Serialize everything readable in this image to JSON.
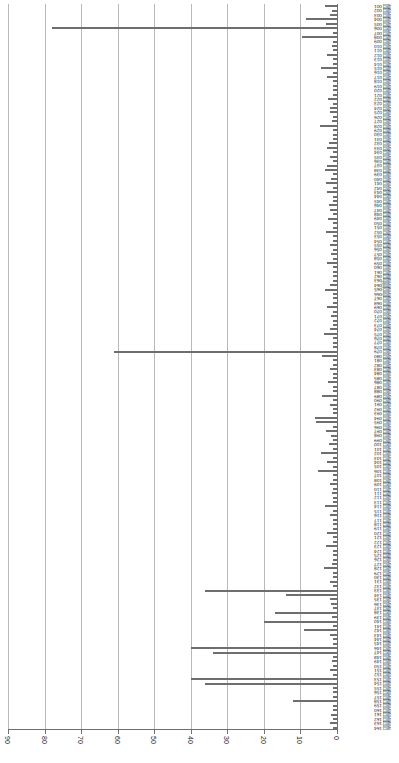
{
  "chart_data": {
    "type": "bar",
    "orientation": "horizontal",
    "title": "",
    "subtitle": "",
    "xlabel": "",
    "ylabel": "",
    "rotated_180": true,
    "axis_direction": "reversed",
    "grid": true,
    "legend": null,
    "bar_color": "#6e6e6e",
    "grid_color": "#b9b9b9",
    "axis_color": "#6f6f6f",
    "xlim": [
      0,
      90
    ],
    "xticks": [
      90,
      80,
      70,
      60,
      50,
      40,
      30,
      20,
      10,
      0
    ],
    "xticklabels": [
      "90",
      "80",
      "70",
      "60",
      "50",
      "40",
      "30",
      "20",
      "10",
      "0"
    ],
    "categories": [
      "项目 001",
      "项目 002",
      "项目 003",
      "项目 004",
      "项目 005",
      "项目 006",
      "项目 007",
      "项目 008",
      "项目 009",
      "项目 010",
      "项目 011",
      "项目 012",
      "项目 013",
      "项目 014",
      "项目 015",
      "项目 016",
      "项目 017",
      "项目 018",
      "项目 019",
      "项目 020",
      "项目 021",
      "项目 022",
      "项目 023",
      "项目 024",
      "项目 025",
      "项目 026",
      "项目 027",
      "项目 028",
      "项目 029",
      "项目 030",
      "项目 031",
      "项目 032",
      "项目 033",
      "项目 034",
      "项目 035",
      "项目 036",
      "项目 037",
      "项目 038",
      "项目 039",
      "项目 040",
      "项目 041",
      "项目 042",
      "项目 043",
      "项目 044",
      "项目 045",
      "项目 046",
      "项目 047",
      "项目 048",
      "项目 049",
      "项目 050",
      "项目 051",
      "项目 052",
      "项目 053",
      "项目 054",
      "项目 055",
      "项目 056",
      "项目 057",
      "项目 058",
      "项目 059",
      "项目 060",
      "项目 061",
      "项目 062",
      "项目 063",
      "项目 064",
      "项目 065",
      "项目 066",
      "项目 067",
      "项目 068",
      "项目 069",
      "项目 070",
      "项目 071",
      "项目 072",
      "项目 073",
      "项目 074",
      "项目 075",
      "项目 076",
      "项目 077",
      "项目 078",
      "项目 079",
      "项目 080",
      "项目 081",
      "项目 082",
      "项目 083",
      "项目 084",
      "项目 085",
      "项目 086",
      "项目 087",
      "项目 088",
      "项目 089",
      "项目 090",
      "项目 091",
      "项目 092",
      "项目 093",
      "项目 094",
      "项目 095",
      "项目 096",
      "项目 097",
      "项目 098",
      "项目 099",
      "项目 100",
      "项目 101",
      "项目 102",
      "项目 103",
      "项目 104",
      "项目 105",
      "项目 106",
      "项目 107",
      "项目 108",
      "项目 109",
      "项目 110",
      "项目 111",
      "项目 112",
      "项目 113",
      "项目 114",
      "项目 115",
      "项目 116",
      "项目 117",
      "项目 118",
      "项目 119",
      "项目 120",
      "项目 121",
      "项目 122",
      "项目 123",
      "项目 124",
      "项目 125",
      "项目 126",
      "项目 127",
      "项目 128",
      "项目 129",
      "项目 130",
      "项目 131",
      "项目 132",
      "项目 133",
      "项目 134",
      "项目 135",
      "项目 136",
      "项目 137",
      "项目 138",
      "项目 139",
      "项目 140",
      "项目 141",
      "项目 142",
      "项目 143",
      "项目 144",
      "项目 145",
      "项目 146",
      "项目 147",
      "项目 148",
      "项目 149",
      "项目 150",
      "项目 151",
      "项目 152",
      "项目 153",
      "项目 154",
      "项目 155",
      "项目 156",
      "项目 157",
      "项目 158",
      "项目 159",
      "项目 160",
      "项目 161",
      "项目 162",
      "项目 163",
      "项目 164"
    ],
    "values": [
      3.2,
      1.5,
      2.0,
      8.5,
      3.0,
      78.0,
      1.2,
      9.5,
      1.0,
      1.4,
      1.2,
      2.6,
      1.0,
      1.1,
      4.5,
      1.0,
      2.6,
      1.0,
      1.0,
      1.1,
      1.0,
      2.4,
      1.2,
      2.0,
      2.0,
      1.0,
      1.4,
      4.6,
      1.2,
      1.0,
      1.0,
      2.2,
      2.8,
      1.2,
      2.0,
      1.0,
      2.6,
      3.2,
      1.0,
      1.6,
      3.0,
      1.0,
      2.6,
      1.0,
      1.2,
      2.2,
      1.8,
      1.0,
      2.4,
      1.0,
      1.2,
      3.0,
      1.0,
      1.0,
      2.0,
      1.1,
      1.6,
      1.0,
      2.8,
      1.0,
      1.0,
      1.2,
      1.0,
      2.0,
      3.4,
      1.0,
      1.2,
      1.0,
      2.8,
      1.0,
      1.6,
      1.0,
      1.0,
      2.0,
      3.6,
      1.0,
      1.2,
      1.0,
      61.0,
      4.0,
      1.0,
      1.0,
      2.0,
      1.2,
      1.0,
      2.4,
      1.0,
      1.2,
      4.2,
      1.0,
      2.0,
      1.0,
      1.0,
      6.0,
      5.8,
      1.2,
      3.0,
      1.6,
      1.0,
      2.2,
      1.0,
      4.4,
      1.0,
      2.8,
      1.0,
      5.2,
      1.0,
      1.2,
      2.0,
      1.0,
      1.4,
      1.0,
      1.0,
      3.4,
      1.0,
      2.0,
      1.2,
      1.0,
      1.0,
      2.6,
      1.0,
      1.0,
      3.0,
      1.0,
      1.2,
      1.0,
      1.4,
      3.6,
      1.0,
      1.0,
      1.8,
      1.0,
      36.0,
      14.0,
      2.0,
      1.6,
      1.2,
      17.0,
      1.4,
      20.0,
      1.0,
      9.0,
      2.0,
      1.2,
      1.0,
      40.0,
      34.0,
      1.0,
      1.4,
      1.0,
      2.0,
      1.0,
      40.0,
      36.0,
      1.0,
      1.2,
      1.0,
      12.0,
      1.0,
      1.0,
      1.6,
      1.0,
      2.0,
      1.0
    ]
  },
  "axis_note": "频数分布"
}
